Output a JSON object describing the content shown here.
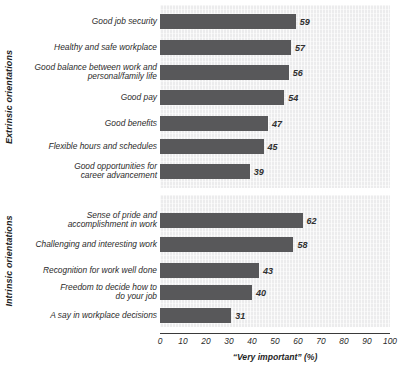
{
  "chart_data": {
    "type": "bar",
    "orientation": "horizontal",
    "title": "",
    "xlabel": "“Very important” (%)",
    "ylabel": "",
    "xlim": [
      0,
      100
    ],
    "xticks": [
      0,
      10,
      20,
      30,
      40,
      50,
      60,
      70,
      80,
      90,
      100
    ],
    "xtick_labels": [
      "0",
      "10",
      "20",
      "30",
      "40",
      "50",
      "60",
      "70",
      "80",
      "90",
      "100"
    ],
    "grid": false,
    "legend": "none",
    "bar_color": "#58585a",
    "panel_background": "#ececed",
    "panels": [
      {
        "group_label": "Extrinsic orientations",
        "categories": [
          "Good job security",
          "Healthy and safe workplace",
          "Good balance between work and\npersonal/family life",
          "Good pay",
          "Good benefits",
          "Flexible hours and schedules",
          "Good opportunities for\ncareer advancement"
        ],
        "values": [
          59,
          57,
          56,
          54,
          47,
          45,
          39
        ],
        "value_labels": [
          "59",
          "57",
          "56",
          "54",
          "47",
          "45",
          "39"
        ]
      },
      {
        "group_label": "Intrinsic orientations",
        "categories": [
          "Sense of pride and\naccomplishment in work",
          "Challenging and interesting work",
          "Recognition for work well done",
          "Freedom to decide how to\ndo your job",
          "A say in workplace decisions"
        ],
        "values": [
          62,
          58,
          43,
          40,
          31
        ],
        "value_labels": [
          "62",
          "58",
          "43",
          "40",
          "31"
        ]
      }
    ]
  }
}
